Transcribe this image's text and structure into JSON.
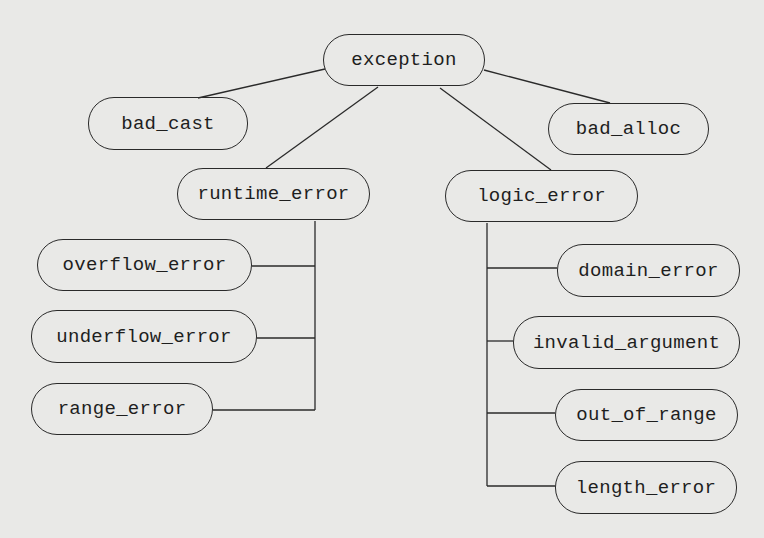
{
  "diagram": {
    "type": "class-hierarchy",
    "nodes": [
      {
        "id": "exception",
        "label": "exception",
        "x": 323,
        "y": 34,
        "w": 162,
        "h": 52
      },
      {
        "id": "bad_cast",
        "label": "bad_cast",
        "x": 88,
        "y": 97,
        "w": 160,
        "h": 53
      },
      {
        "id": "bad_alloc",
        "label": "bad_alloc",
        "x": 548,
        "y": 103,
        "w": 161,
        "h": 52
      },
      {
        "id": "runtime_error",
        "label": "runtime_error",
        "x": 177,
        "y": 168,
        "w": 193,
        "h": 52
      },
      {
        "id": "logic_error",
        "label": "logic_error",
        "x": 445,
        "y": 170,
        "w": 193,
        "h": 52
      },
      {
        "id": "overflow_error",
        "label": "overflow_error",
        "x": 37,
        "y": 239,
        "w": 215,
        "h": 52
      },
      {
        "id": "underflow_error",
        "label": "underflow_error",
        "x": 31,
        "y": 310,
        "w": 226,
        "h": 53
      },
      {
        "id": "range_error",
        "label": "range_error",
        "x": 31,
        "y": 383,
        "w": 182,
        "h": 52
      },
      {
        "id": "domain_error",
        "label": "domain_error",
        "x": 557,
        "y": 244,
        "w": 183,
        "h": 53
      },
      {
        "id": "invalid_argument",
        "label": "invalid_argument",
        "x": 513,
        "y": 316,
        "w": 227,
        "h": 53
      },
      {
        "id": "out_of_range",
        "label": "out_of_range",
        "x": 555,
        "y": 389,
        "w": 183,
        "h": 52
      },
      {
        "id": "length_error",
        "label": "length_error",
        "x": 555,
        "y": 461,
        "w": 182,
        "h": 53
      }
    ],
    "edges": [
      {
        "from": "exception",
        "to": "bad_cast"
      },
      {
        "from": "exception",
        "to": "bad_alloc"
      },
      {
        "from": "exception",
        "to": "runtime_error"
      },
      {
        "from": "exception",
        "to": "logic_error"
      },
      {
        "from": "runtime_error",
        "to": "overflow_error"
      },
      {
        "from": "runtime_error",
        "to": "underflow_error"
      },
      {
        "from": "runtime_error",
        "to": "range_error"
      },
      {
        "from": "logic_error",
        "to": "domain_error"
      },
      {
        "from": "logic_error",
        "to": "invalid_argument"
      },
      {
        "from": "logic_error",
        "to": "out_of_range"
      },
      {
        "from": "logic_error",
        "to": "length_error"
      }
    ],
    "line_color": "#2a2a2a",
    "background": "#e9e9e7"
  }
}
